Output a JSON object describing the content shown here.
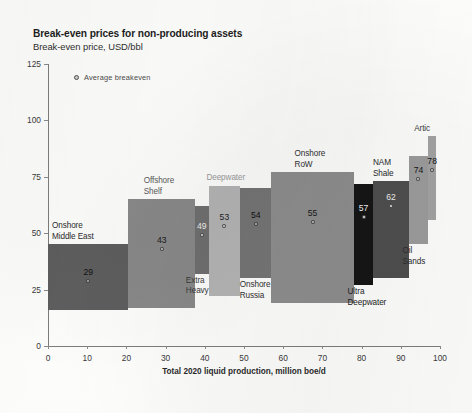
{
  "header": {
    "title": "Break-even prices for non-producing assets",
    "subtitle": "Break-even price, USD/bbl"
  },
  "legend": {
    "marker_name": "average-breakeven-marker",
    "label": "Average breakeven"
  },
  "chart_data": {
    "type": "bar",
    "title": "Break-even prices for non-producing assets",
    "subtitle": "Break-even price, USD/bbl",
    "xlabel": "Total 2020 liquid production, million boe/d",
    "ylabel": "Break-even price, USD/bbl",
    "xlim": [
      0,
      100
    ],
    "ylim": [
      0,
      125
    ],
    "xticks": [
      0,
      10,
      20,
      30,
      40,
      50,
      60,
      70,
      80,
      90,
      100
    ],
    "yticks": [
      0,
      25,
      50,
      75,
      100,
      125
    ],
    "grid": false,
    "legend_position": "top-left",
    "legend_entries": [
      "Average breakeven"
    ],
    "note": "Cost-curve / marimekko: each segment spans an x-range of cumulative production and a y-range band of break-even price; the dot marks the average break-even.",
    "categories": [
      "Onshore Middle East",
      "Offshore Shelf",
      "Extra Heavy oil",
      "Deepwater",
      "Onshore Russia",
      "Onshore RoW",
      "Ultra Deepwater",
      "NAM Shale",
      "Oil Sands",
      "Artic"
    ],
    "values": [
      29,
      43,
      49,
      53,
      54,
      55,
      57,
      62,
      74,
      78
    ],
    "segments": [
      {
        "label": "Onshore\nMiddle East",
        "average": 29,
        "x_start": 0,
        "x_end": 20.5,
        "y_low": 16,
        "y_high": 45,
        "color": "#5e5e5e",
        "value_color": "#101010",
        "label_color": "#2c2c2c",
        "label_pos": "above-left",
        "value_shown": "29"
      },
      {
        "label": "Offshore\nShelf",
        "average": 43,
        "x_start": 20.5,
        "x_end": 37.5,
        "y_low": 17,
        "y_high": 65,
        "color": "#898989",
        "value_color": "#1a1a1a",
        "label_color": "#5a5a5a",
        "label_pos": "above",
        "value_shown": "43"
      },
      {
        "label": "Extra\nHeavy oil",
        "average": 49,
        "x_start": 37.5,
        "x_end": 41,
        "y_low": 32,
        "y_high": 62,
        "color": "#6f6f6f",
        "value_color": "#f0f0f0",
        "label_color": "#3a3a3a",
        "label_pos": "below",
        "value_shown": "49"
      },
      {
        "label": "Deepwater",
        "average": 53,
        "x_start": 41,
        "x_end": 49,
        "y_low": 22,
        "y_high": 71,
        "color": "#b4b4b4",
        "value_color": "#1c1c1c",
        "label_color": "#9a9a9a",
        "label_pos": "above",
        "value_shown": "53"
      },
      {
        "label": "Onshore\nRussia",
        "average": 54,
        "x_start": 49,
        "x_end": 57,
        "y_low": 30,
        "y_high": 70,
        "color": "#757575",
        "value_color": "#101010",
        "label_color": "#2f2f2f",
        "label_pos": "below",
        "value_shown": "54"
      },
      {
        "label": "Onshore\nRoW",
        "average": 55,
        "x_start": 57,
        "x_end": 78,
        "y_low": 19,
        "y_high": 77,
        "color": "#8d8d8d",
        "value_color": "#171717",
        "label_color": "#2f2f2f",
        "label_pos": "above",
        "value_shown": "55"
      },
      {
        "label": "Ultra\nDeepwater",
        "average": 57,
        "x_start": 78,
        "x_end": 83,
        "y_low": 27,
        "y_high": 72,
        "color": "#151515",
        "value_color": "#f4f4f4",
        "label_color": "#232323",
        "label_pos": "below",
        "value_shown": "57"
      },
      {
        "label": "NAM\nShale",
        "average": 62,
        "x_start": 83,
        "x_end": 92,
        "y_low": 30,
        "y_high": 73,
        "color": "#4e4e4e",
        "value_color": "#ededed",
        "label_color": "#272727",
        "label_pos": "above",
        "value_shown": "62"
      },
      {
        "label": "Oil\nSands",
        "average": 74,
        "x_start": 92,
        "x_end": 97,
        "y_low": 45,
        "y_high": 84,
        "color": "#9b9b9b",
        "value_color": "#141414",
        "label_color": "#2c2c2c",
        "label_pos": "below",
        "value_shown": "74"
      },
      {
        "label": "Artic",
        "average": 78,
        "x_start": 97,
        "x_end": 99,
        "y_low": 56,
        "y_high": 93,
        "color": "#a2a2a2",
        "value_color": "#141414",
        "label_color": "#3b3b3b",
        "label_pos": "above",
        "value_shown": "78"
      }
    ]
  }
}
